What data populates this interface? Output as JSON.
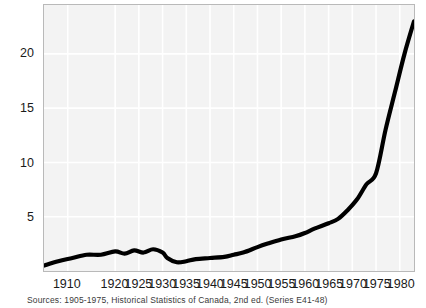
{
  "figure": {
    "background_color": "#ffffff",
    "plot_background_color": "#f3f3f3",
    "frame_color": "#b9b9b9",
    "grid_color": "#ffffff",
    "line_color": "#000000"
  },
  "source_note": "Sources: 1905-1975, Historical Statistics of Canada, 2nd ed. (Series E41-48)",
  "chart_data": {
    "type": "line",
    "title": "",
    "subtitle": "",
    "xlabel": "",
    "ylabel": "",
    "xlim": [
      1905,
      1983
    ],
    "ylim": [
      0,
      24.5
    ],
    "grid": true,
    "legend": "none",
    "yticks": [
      5,
      10,
      15,
      20
    ],
    "ytick_labels": [
      "5",
      "10",
      "15",
      "20"
    ],
    "xticks": [
      1910,
      1920,
      1925,
      1930,
      1935,
      1940,
      1945,
      1950,
      1955,
      1960,
      1965,
      1970,
      1975,
      1980
    ],
    "xtick_labels": [
      "1910",
      "1920",
      "1925",
      "1930",
      "1935",
      "1940",
      "1945",
      "1950",
      "1955",
      "1960",
      "1965",
      "1970",
      "1975",
      "1980"
    ],
    "series": [
      {
        "name": "value",
        "x": [
          1905,
          1908,
          1911,
          1914,
          1917,
          1920,
          1922,
          1924,
          1926,
          1928,
          1930,
          1931,
          1933,
          1935,
          1937,
          1940,
          1943,
          1945,
          1947,
          1950,
          1952,
          1955,
          1958,
          1960,
          1962,
          1965,
          1967,
          1969,
          1971,
          1973,
          1975,
          1977,
          1979,
          1981,
          1983
        ],
        "values": [
          0.5,
          0.9,
          1.2,
          1.5,
          1.5,
          1.8,
          1.6,
          1.9,
          1.7,
          2.0,
          1.7,
          1.2,
          0.8,
          0.9,
          1.1,
          1.2,
          1.3,
          1.5,
          1.7,
          2.2,
          2.5,
          2.9,
          3.2,
          3.5,
          3.9,
          4.4,
          4.8,
          5.6,
          6.6,
          8.0,
          9.0,
          13.0,
          16.5,
          20.0,
          23.0
        ]
      }
    ]
  }
}
